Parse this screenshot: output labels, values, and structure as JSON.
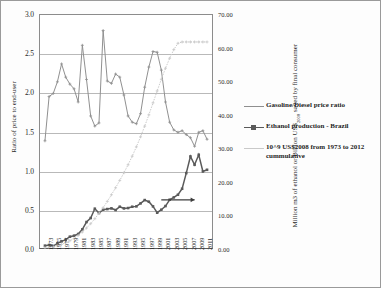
{
  "chart_data": {
    "type": "line",
    "title": "",
    "xlabel": "",
    "ylabel": "Ratio of price to end-user",
    "y2label": "Million m3 of ethanol or Billion US$2008 saved by final consumer",
    "grid": true,
    "legend_position": "right",
    "ylim": [
      0.0,
      3.0
    ],
    "y2lim": [
      0.0,
      70.0
    ],
    "y_ticks": [
      "0.0",
      "0.5",
      "1.0",
      "1.5",
      "2.0",
      "2.5",
      "3.0"
    ],
    "y_tick_values": [
      0.0,
      0.5,
      1.0,
      1.5,
      2.0,
      2.5,
      3.0
    ],
    "y2_ticks": [
      "0.00",
      "10.00",
      "20.00",
      "30.00",
      "40.00",
      "50.00",
      "60.00",
      "70.00"
    ],
    "y2_tick_values": [
      0,
      10,
      20,
      30,
      40,
      50,
      60,
      70
    ],
    "x_tick_labels": [
      "1973",
      "1975",
      "1977",
      "1979",
      "1981",
      "1983",
      "1985",
      "1987",
      "1989",
      "1991",
      "1993",
      "1995",
      "1997",
      "1999",
      "2001",
      "2003",
      "2005",
      "2007",
      "2009",
      "2011"
    ],
    "x": [
      1973,
      1974,
      1975,
      1976,
      1977,
      1978,
      1979,
      1980,
      1981,
      1982,
      1983,
      1984,
      1985,
      1986,
      1987,
      1988,
      1989,
      1990,
      1991,
      1992,
      1993,
      1994,
      1995,
      1996,
      1997,
      1998,
      1999,
      2000,
      2001,
      2002,
      2003,
      2004,
      2005,
      2006,
      2007,
      2008,
      2009,
      2010,
      2011,
      2012
    ],
    "series": [
      {
        "name": "Gasoline/Diesel price ratio",
        "axis": "left",
        "color": "#8f8f8f",
        "marker": "cross",
        "values": [
          1.38,
          1.95,
          1.99,
          2.14,
          2.37,
          2.2,
          2.11,
          2.05,
          1.88,
          2.61,
          2.17,
          1.7,
          1.57,
          1.61,
          2.8,
          2.15,
          2.12,
          2.24,
          2.2,
          1.97,
          1.7,
          1.62,
          1.6,
          1.73,
          2.07,
          2.33,
          2.53,
          2.52,
          2.29,
          1.88,
          1.62,
          1.52,
          1.49,
          1.51,
          1.46,
          1.42,
          1.31,
          1.49,
          1.51,
          1.4
        ]
      },
      {
        "name": "Ethanol production - Brazil",
        "axis": "right",
        "color": "#5a5a5a",
        "marker": "square",
        "values": [
          0.7,
          0.9,
          0.6,
          1.4,
          2.0,
          2.5,
          3.4,
          3.7,
          4.2,
          5.6,
          7.8,
          9.0,
          11.8,
          10.5,
          11.5,
          11.7,
          11.9,
          11.4,
          12.4,
          11.9,
          12.0,
          12.4,
          12.5,
          13.4,
          14.4,
          13.9,
          12.5,
          10.6,
          11.5,
          12.6,
          14.5,
          15.2,
          16.0,
          17.8,
          22.5,
          27.5,
          25.0,
          28.0,
          23.0,
          23.5
        ]
      },
      {
        "name": "10^9 US$2008 from 1973 to 2012 cummulative",
        "axis": "right",
        "color": "#c9c9c9",
        "marker": "cross",
        "values": [
          0.1,
          0.2,
          0.4,
          0.7,
          1.1,
          1.6,
          2.2,
          2.9,
          3.8,
          4.8,
          6.0,
          7.3,
          8.8,
          10.4,
          12.1,
          14.0,
          16.0,
          18.1,
          20.3,
          22.6,
          25.0,
          27.6,
          30.4,
          33.4,
          36.6,
          40.0,
          43.6,
          47.2,
          50.7,
          54.0,
          57.0,
          59.6,
          61.5,
          61.9,
          61.9,
          61.9,
          61.9,
          61.9,
          61.9,
          61.9
        ]
      }
    ],
    "annotations": [
      {
        "name": "right-axis-arrow",
        "type": "arrow",
        "direction": "right",
        "from_x": 2001,
        "to_x": 2009,
        "at_left_value": 0.62,
        "note": "arrow indicating ethanol series reads on right axis"
      }
    ]
  },
  "legend": {
    "items": [
      {
        "label": "Gasoline/Diesel price ratio",
        "color": "#8f8f8f",
        "marker": "cross"
      },
      {
        "label": "Ethanol production - Brazil",
        "color": "#5a5a5a",
        "marker": "square"
      },
      {
        "label": "10^9 US$2008 from 1973 to 2012 cummulative",
        "color": "#c9c9c9",
        "marker": "cross"
      }
    ]
  },
  "axes": {
    "left_title": "Ratio of price to end-user",
    "right_title_part1": "Million m3 of ethanol or Billion US$",
    "right_title_sub": "2008",
    "right_title_part2": " saved by final consumer"
  }
}
